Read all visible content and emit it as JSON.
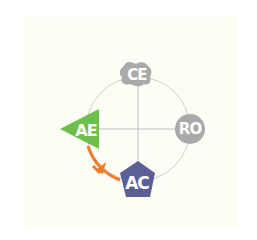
{
  "diagram": {
    "type": "kolb-learning-cycle",
    "nodes": [
      {
        "id": "CE",
        "label": "CE",
        "shape": "blob",
        "color": "#a9a9a9",
        "position": "top"
      },
      {
        "id": "RO",
        "label": "RO",
        "shape": "circle",
        "color": "#a9a9a9",
        "position": "right"
      },
      {
        "id": "AC",
        "label": "AC",
        "shape": "pentagon",
        "color": "#5b5f96",
        "position": "bottom"
      },
      {
        "id": "AE",
        "label": "AE",
        "shape": "triangle",
        "color": "#6cbf4a",
        "position": "left"
      }
    ],
    "arrow": {
      "from": "AC",
      "to": "AE",
      "color": "#ef7d2a"
    },
    "colors": {
      "background": "#fdfdf5",
      "circle": "#cfcfcf",
      "axes": "#bdbdbd"
    }
  }
}
